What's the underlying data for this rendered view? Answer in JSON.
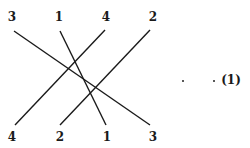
{
  "diagram": {
    "top_labels": [
      "3",
      "1",
      "4",
      "2"
    ],
    "bottom_labels": [
      "4",
      "2",
      "1",
      "3"
    ],
    "equation_number": "(1)",
    "line_color": "#1a1a1a",
    "connections": [
      {
        "label": "3",
        "from_top_index": 0,
        "to_bottom_index": 3
      },
      {
        "label": "1",
        "from_top_index": 1,
        "to_bottom_index": 2
      },
      {
        "label": "4",
        "from_top_index": 2,
        "to_bottom_index": 0
      },
      {
        "label": "2",
        "from_top_index": 3,
        "to_bottom_index": 1
      }
    ]
  }
}
